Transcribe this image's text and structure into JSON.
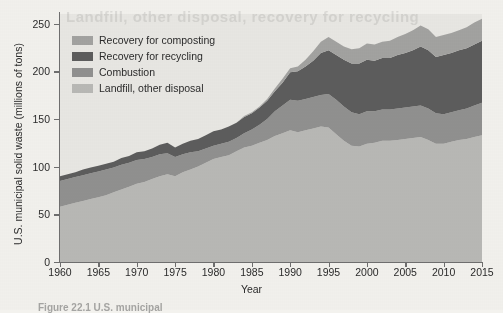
{
  "figure": {
    "caption": "Figure 22.1  U.S. municipal",
    "bleed_through_text": "Landfill, other disposal, recovery for recycling"
  },
  "axes": {
    "y_title": "U.S. municipal solid waste (millions of tons)",
    "x_title": "Year",
    "y_ticks": [
      "0",
      "50",
      "100",
      "150",
      "200",
      "250"
    ],
    "x_ticks": [
      "1960",
      "1965",
      "1970",
      "1975",
      "1980",
      "1985",
      "1990",
      "1995",
      "2000",
      "2005",
      "2010",
      "2015"
    ]
  },
  "legend": {
    "items": [
      {
        "label": "Recovery for composting",
        "color": "#a3a3a1"
      },
      {
        "label": "Recovery for recycling",
        "color": "#5d5d5d"
      },
      {
        "label": "Combustion",
        "color": "#919190"
      },
      {
        "label": "Landfill, other disposal",
        "color": "#b9b9b6"
      }
    ]
  },
  "colors": {
    "plot_background": "#e9e8e4",
    "page_background": "#f3f2ee",
    "axis": "#6f6f6f",
    "text": "#2b2b2b"
  },
  "chart_data": {
    "type": "area",
    "stacked": true,
    "title": "",
    "xlabel": "Year",
    "ylabel": "U.S. municipal solid waste (millions of tons)",
    "xlim": [
      1960,
      2015
    ],
    "ylim": [
      0,
      260
    ],
    "grid": false,
    "legend_position": "top-left-inside",
    "x": [
      1960,
      1961,
      1962,
      1963,
      1964,
      1965,
      1966,
      1967,
      1968,
      1969,
      1970,
      1971,
      1972,
      1973,
      1974,
      1975,
      1976,
      1977,
      1978,
      1979,
      1980,
      1981,
      1982,
      1983,
      1984,
      1985,
      1986,
      1987,
      1988,
      1989,
      1990,
      1991,
      1992,
      1993,
      1994,
      1995,
      1996,
      1997,
      1998,
      1999,
      2000,
      2001,
      2002,
      2003,
      2004,
      2005,
      2006,
      2007,
      2008,
      2009,
      2010,
      2011,
      2012,
      2013,
      2014,
      2015
    ],
    "series": [
      {
        "name": "Landfill, other disposal",
        "values": [
          58,
          60,
          62,
          64,
          66,
          68,
          70,
          73,
          76,
          79,
          82,
          84,
          87,
          90,
          92,
          90,
          94,
          97,
          100,
          104,
          108,
          110,
          112,
          116,
          120,
          122,
          125,
          128,
          132,
          135,
          138,
          136,
          138,
          140,
          142,
          141,
          134,
          127,
          122,
          121,
          124,
          125,
          127,
          127,
          128,
          129,
          130,
          131,
          128,
          124,
          124,
          126,
          128,
          129,
          131,
          133
        ]
      },
      {
        "name": "Combustion",
        "values": [
          27,
          27,
          27,
          27,
          27,
          27,
          27,
          26,
          26,
          25,
          25,
          24,
          23,
          23,
          22,
          20,
          19,
          18,
          16,
          15,
          14,
          14,
          14,
          14,
          15,
          17,
          19,
          22,
          26,
          29,
          32,
          33,
          33,
          33,
          33,
          35,
          36,
          36,
          35,
          34,
          34,
          33,
          33,
          33,
          33,
          33,
          33,
          33,
          33,
          32,
          31,
          31,
          31,
          32,
          33,
          34
        ]
      },
      {
        "name": "Recovery for recycling",
        "values": [
          5,
          5,
          5,
          6,
          6,
          6,
          6,
          6,
          7,
          7,
          8,
          8,
          9,
          10,
          11,
          10,
          11,
          12,
          13,
          14,
          15,
          15,
          16,
          16,
          17,
          17,
          18,
          19,
          21,
          24,
          29,
          31,
          34,
          38,
          44,
          46,
          47,
          49,
          51,
          53,
          54,
          53,
          54,
          54,
          56,
          57,
          59,
          62,
          61,
          59,
          62,
          62,
          63,
          63,
          64,
          65
        ]
      },
      {
        "name": "Recovery for composting",
        "values": [
          0,
          0,
          0,
          0,
          0,
          0,
          0,
          0,
          0,
          0,
          0,
          0,
          0,
          0,
          0,
          0,
          0,
          0,
          0,
          0,
          0,
          0,
          0,
          0,
          1,
          1,
          1,
          2,
          3,
          4,
          4,
          5,
          7,
          10,
          12,
          14,
          14,
          14,
          15,
          16,
          17,
          17,
          17,
          18,
          19,
          20,
          21,
          22,
          22,
          21,
          21,
          21,
          21,
          22,
          23,
          23
        ]
      }
    ],
    "totals": [
      90,
      92,
      94,
      97,
      99,
      101,
      103,
      105,
      109,
      111,
      115,
      116,
      119,
      123,
      125,
      120,
      124,
      127,
      129,
      133,
      137,
      139,
      142,
      146,
      153,
      157,
      163,
      171,
      182,
      192,
      203,
      205,
      212,
      221,
      231,
      236,
      231,
      226,
      223,
      224,
      229,
      228,
      231,
      232,
      236,
      239,
      243,
      248,
      244,
      236,
      238,
      240,
      243,
      246,
      251,
      255
    ]
  }
}
